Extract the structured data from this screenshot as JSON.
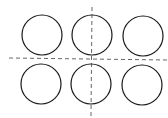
{
  "diagram": {
    "stroke_color": "#1a1a1a",
    "dash_color": "#555555",
    "background": "#ffffff",
    "circles": [
      {
        "cx": 42,
        "cy": 35,
        "r": 20
      },
      {
        "cx": 92,
        "cy": 35,
        "r": 20
      },
      {
        "cx": 143,
        "cy": 36,
        "r": 20
      },
      {
        "cx": 41,
        "cy": 84,
        "r": 20
      },
      {
        "cx": 91,
        "cy": 84,
        "r": 20
      },
      {
        "cx": 142,
        "cy": 85,
        "r": 20
      }
    ],
    "axes": [
      {
        "name": "vertical-axis",
        "x1": 92,
        "y1": 7,
        "x2": 91,
        "y2": 116
      },
      {
        "name": "horizontal-axis",
        "x1": 9,
        "y1": 58,
        "x2": 168,
        "y2": 60
      }
    ]
  }
}
